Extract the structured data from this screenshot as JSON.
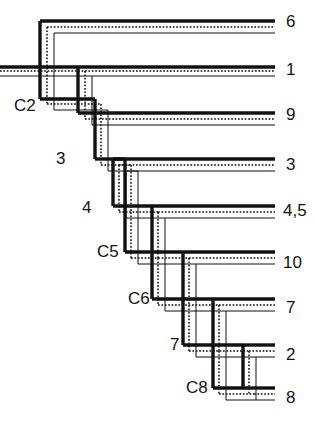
{
  "figure": {
    "type": "dendrogram",
    "width": 315,
    "height": 424,
    "background_color": "#ffffff",
    "line_styles": [
      {
        "name": "thick-solid",
        "color": "#111111",
        "width": 3.2,
        "dash": "none"
      },
      {
        "name": "dotted",
        "color": "#111111",
        "width": 1.3,
        "dash": "1.6 1.6"
      },
      {
        "name": "thin-solid",
        "color": "#111111",
        "width": 1.0,
        "dash": "none"
      }
    ]
  },
  "tip_labels": [
    {
      "id": "tip-6",
      "text": "6",
      "x": 286,
      "y": 22
    },
    {
      "id": "tip-1",
      "text": "1",
      "x": 286,
      "y": 70
    },
    {
      "id": "tip-9",
      "text": "9",
      "x": 286,
      "y": 115
    },
    {
      "id": "tip-3",
      "text": "3",
      "x": 286,
      "y": 165
    },
    {
      "id": "tip-45",
      "text": "4,5",
      "x": 286,
      "y": 211
    },
    {
      "id": "tip-10",
      "text": "10",
      "x": 286,
      "y": 263
    },
    {
      "id": "tip-7",
      "text": "7",
      "x": 286,
      "y": 308
    },
    {
      "id": "tip-2",
      "text": "2",
      "x": 286,
      "y": 355
    },
    {
      "id": "tip-8",
      "text": "8",
      "x": 286,
      "y": 398
    }
  ],
  "node_labels": [
    {
      "id": "node-c2",
      "text": "C2",
      "x": 16,
      "y": 108
    },
    {
      "id": "node-3",
      "text": "3",
      "x": 58,
      "y": 158
    },
    {
      "id": "node-4",
      "text": "4",
      "x": 82,
      "y": 209
    },
    {
      "id": "node-c5",
      "text": "C5",
      "x": 100,
      "y": 254
    },
    {
      "id": "node-c6",
      "text": "C6",
      "x": 131,
      "y": 298
    },
    {
      "id": "node-7",
      "text": "7",
      "x": 171,
      "y": 341
    },
    {
      "id": "node-c8",
      "text": "C8",
      "x": 186,
      "y": 381
    }
  ],
  "tree_structure": {
    "root_x": 0,
    "root_y": 68,
    "nodes": [
      {
        "name": "root",
        "x": 40,
        "y_top": 22,
        "y_bottom": 68,
        "children": [
          "6",
          "C2"
        ]
      },
      {
        "name": "C2",
        "x": 70,
        "y_top": 68,
        "y_bottom": 115,
        "children": [
          "1",
          "3"
        ]
      },
      {
        "name": "3",
        "x": 96,
        "y_top": 115,
        "y_bottom": 165,
        "children": [
          "9",
          "4"
        ]
      },
      {
        "name": "4",
        "x": 121,
        "y_top": 165,
        "y_bottom": 211,
        "children": [
          "3",
          "C5"
        ]
      },
      {
        "name": "C5",
        "x": 150,
        "y_top": 211,
        "y_bottom": 263,
        "children": [
          "4,5",
          "C6"
        ]
      },
      {
        "name": "C6",
        "x": 182,
        "y_top": 263,
        "y_bottom": 308,
        "children": [
          "10",
          "7"
        ]
      },
      {
        "name": "7",
        "x": 210,
        "y_top": 308,
        "y_bottom": 355,
        "children": [
          "7",
          "C8"
        ]
      },
      {
        "name": "C8",
        "x": 240,
        "y_top": 355,
        "y_bottom": 398,
        "children": [
          "2",
          "8"
        ]
      }
    ],
    "tip_end_x": 275
  }
}
